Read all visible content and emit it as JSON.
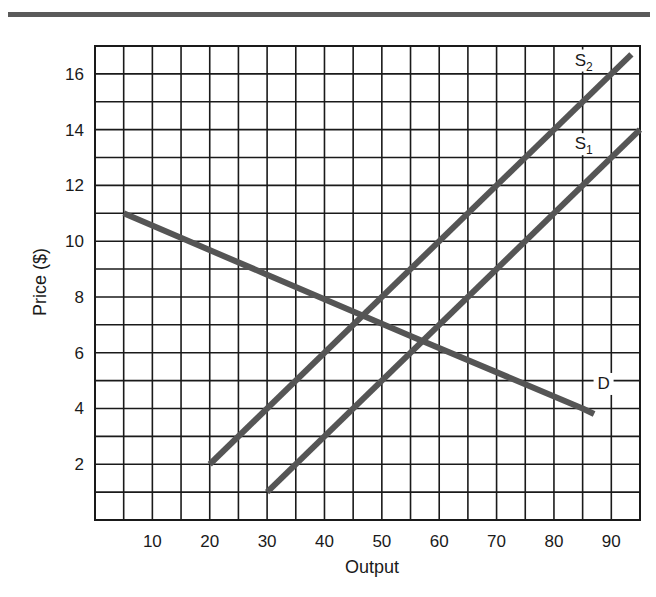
{
  "chart_data": {
    "type": "line",
    "title": "",
    "xlabel": "Output",
    "ylabel": "Price ($)",
    "xlim": [
      0,
      95
    ],
    "ylim": [
      0,
      17
    ],
    "grid": true,
    "grid_step": {
      "x": 5,
      "y": 1
    },
    "x_ticks": [
      10,
      20,
      30,
      40,
      50,
      60,
      70,
      80,
      90
    ],
    "y_ticks": [
      2,
      4,
      6,
      8,
      10,
      12,
      14,
      16
    ],
    "series": [
      {
        "name": "D",
        "label": "D",
        "role": "demand",
        "points": [
          [
            5,
            11
          ],
          [
            30,
            8.8
          ],
          [
            55,
            6.6
          ],
          [
            85,
            4
          ],
          [
            87,
            3.8
          ]
        ]
      },
      {
        "name": "S1",
        "label": "S",
        "subscript": "1",
        "role": "supply",
        "points": [
          [
            30,
            1
          ],
          [
            95,
            14
          ]
        ]
      },
      {
        "name": "S2",
        "label": "S",
        "subscript": "2",
        "role": "supply",
        "points": [
          [
            20,
            2
          ],
          [
            93.5,
            16.7
          ]
        ]
      }
    ],
    "annotations": [
      {
        "text": "S2",
        "x": 85,
        "y": 16.3
      },
      {
        "text": "S1",
        "x": 85,
        "y": 13.3
      },
      {
        "text": "D",
        "x": 89,
        "y": 4.7
      }
    ],
    "legend": "none (direct labels on curves)"
  },
  "colors": {
    "grid": "#1a1a1a",
    "curves": "#555555",
    "top_rule": "#5a5a5a"
  }
}
